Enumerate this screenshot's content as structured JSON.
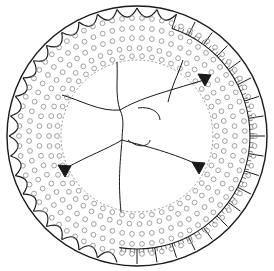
{
  "figure": {
    "center": [
      137,
      136
    ],
    "outer_radius": 130,
    "rim_inner_radius": 113,
    "band_inner_radius": 76,
    "pore_rings": [
      118,
      108,
      98,
      88,
      80
    ],
    "colors": {
      "ink": "#1a1a1a",
      "pore": "#8a8a8a",
      "background": "#ffffff"
    },
    "dark_spots": [
      {
        "x": 205,
        "y": 79
      },
      {
        "x": 65,
        "y": 170
      },
      {
        "x": 199,
        "y": 167
      }
    ]
  }
}
